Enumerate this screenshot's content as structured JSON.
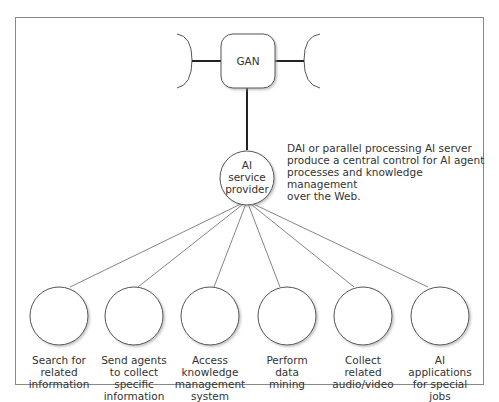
{
  "diagram": {
    "hub": {
      "label": "GAN"
    },
    "service": {
      "label": "AI\nservice\nprovider"
    },
    "description": "DAI or parallel processing AI server\nproduce a central control for AI agent\nprocesses and knowledge management\nover the Web.",
    "nodes": [
      {
        "label": "Search for\nrelated\ninformation"
      },
      {
        "label": "Send agents\nto collect\nspecific\ninformation"
      },
      {
        "label": "Access\nknowledge\nmanagement\nsystem"
      },
      {
        "label": "Perform\ndata\nmining"
      },
      {
        "label": "Collect\nrelated\naudio/video"
      },
      {
        "label": "AI\napplications\nfor special\njobs"
      }
    ]
  },
  "colors": {
    "frame": "#888888",
    "line": "#222222",
    "thin_line": "#666666"
  }
}
